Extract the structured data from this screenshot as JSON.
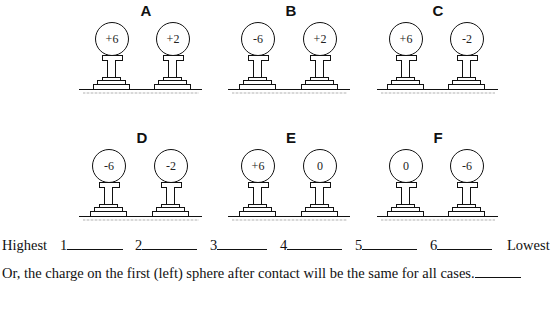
{
  "groups": [
    {
      "label": "A",
      "left_charge": "+6",
      "right_charge": "+2"
    },
    {
      "label": "B",
      "left_charge": "-6",
      "right_charge": "+2"
    },
    {
      "label": "C",
      "left_charge": "+6",
      "right_charge": "-2"
    },
    {
      "label": "D",
      "left_charge": "-6",
      "right_charge": "-2"
    },
    {
      "label": "E",
      "left_charge": "+6",
      "right_charge": "0"
    },
    {
      "label": "F",
      "left_charge": "0",
      "right_charge": "-6"
    }
  ],
  "ranking": {
    "highest_label": "Highest",
    "lowest_label": "Lowest",
    "slots": [
      "1",
      "2",
      "3",
      "4",
      "5",
      "6"
    ]
  },
  "alternative": {
    "text": "Or, the charge on the first (left) sphere after contact will be the same for all cases."
  }
}
